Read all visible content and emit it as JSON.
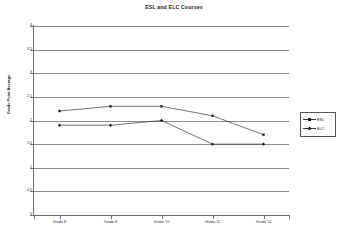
{
  "chart_data": {
    "type": "line",
    "title": "ESL and ELC Courses",
    "xlabel": "",
    "ylabel": "Grade Point Average",
    "categories": [
      "Grade 8",
      "Grade 9",
      "Grade 10",
      "Grade 11",
      "Grade 12"
    ],
    "series": [
      {
        "name": "ESL",
        "values": [
          2.2,
          2.3,
          2.3,
          2.1,
          1.7
        ]
      },
      {
        "name": "ELC",
        "values": [
          1.9,
          1.9,
          2.0,
          1.5,
          1.5
        ]
      }
    ],
    "ylim": [
      0,
      4
    ],
    "yticks": [
      "0",
      "0.5",
      "1",
      "1.5",
      "2",
      "2.5",
      "3",
      "3.5",
      "4"
    ],
    "ytick_values": [
      0,
      0.5,
      1,
      1.5,
      2,
      2.5,
      3,
      3.5,
      4
    ],
    "grid": true,
    "legend_position": "right",
    "colors": {
      "line": "#3a3a3a",
      "marker": "#222222",
      "gridline": "#8d8d8d",
      "axis": "#6e6e6e",
      "text": "#1a1a1a",
      "background": "#ffffff"
    }
  },
  "legend": {
    "items": [
      {
        "label": "ESL",
        "marker": "square"
      },
      {
        "label": "ELC",
        "marker": "diamond"
      }
    ]
  }
}
